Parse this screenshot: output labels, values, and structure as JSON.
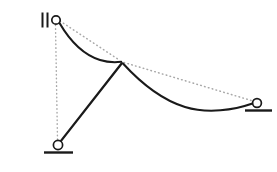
{
  "figure": {
    "background_color": "#ffffff",
    "width": 277,
    "height": 172,
    "stroke_color": "#1a1a1a",
    "dotted_color": "#a8a8a8"
  },
  "nodes": {
    "top_left": {
      "label": "top-left-pin",
      "x": 56,
      "y": 20,
      "radius": 4.2
    },
    "apex": {
      "label": "mid-joint",
      "x": 122,
      "y": 62
    },
    "bottom_left": {
      "label": "bottom-left-pin",
      "x": 58,
      "y": 145,
      "radius": 4.6
    },
    "right": {
      "label": "right-pin",
      "x": 257,
      "y": 103,
      "radius": 4.4
    }
  },
  "members": {
    "left_curve": {
      "name": "left-curved-member",
      "path": "M 59.5 23 C 70 41, 84 55, 100 60 C 108 62.5, 115 62.5, 121.2 61.8",
      "style": "solid"
    },
    "right_curve": {
      "name": "right-curved-member",
      "path": "M 123 63.5 C 139 81, 159 99, 185 107 C 208 114, 234 110, 252.5 103.5",
      "style": "solid"
    },
    "diagonal": {
      "name": "diagonal-strut",
      "x1": 121.8,
      "y1": 63.2,
      "x2": 60.6,
      "y2": 141.4,
      "style": "solid"
    }
  },
  "reference_lines": {
    "upper_chord": {
      "name": "upper-dotted-chord",
      "x1": 60,
      "y1": 21,
      "x2": 120,
      "y2": 60.5
    },
    "lower_chord": {
      "name": "lower-dotted-chord",
      "x1": 124,
      "y1": 62.5,
      "x2": 253,
      "y2": 101
    },
    "vertical_datum": {
      "name": "vertical-dotted-datum",
      "x1": 55.5,
      "y1": 25,
      "x2": 57.5,
      "y2": 140
    }
  },
  "supports": {
    "bottom_left_ground": {
      "name": "bottom-left-ground-line",
      "x1": 44,
      "y1": 152.5,
      "x2": 73,
      "y2": 152.5
    },
    "right_ground": {
      "name": "right-ground-line",
      "x1": 245,
      "y1": 110.5,
      "x2": 272,
      "y2": 110.5
    },
    "parallel_marks": {
      "name": "parallel-slider-marks",
      "bar1_x": 42.5,
      "bar2_x": 47.5,
      "y_top": 12.5,
      "y_bottom": 27.5
    }
  }
}
